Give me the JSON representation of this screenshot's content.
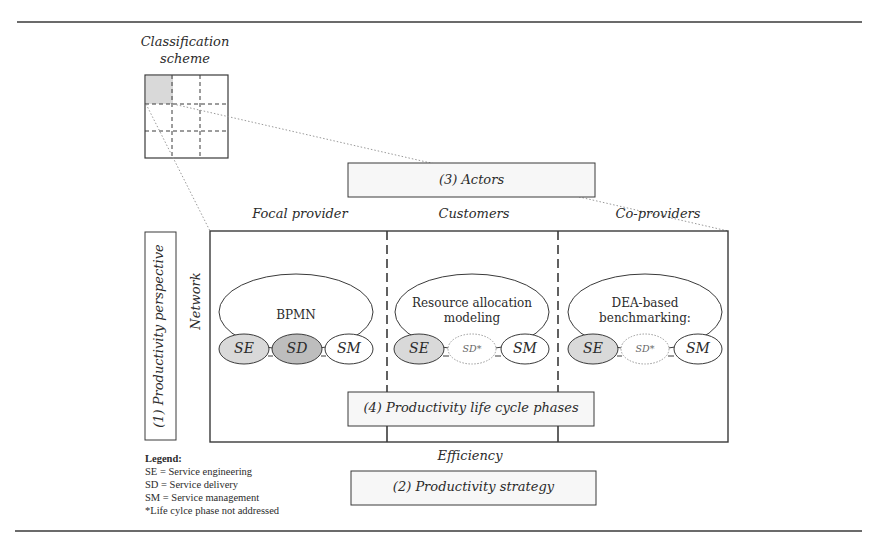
{
  "classification": {
    "title_line1": "Classification",
    "title_line2": "scheme"
  },
  "dimensions": {
    "actors": "(3) Actors",
    "perspective": "(1) Productivity perspective",
    "strategy": "(2) Productivity strategy",
    "phases": "(4) Productivity life cycle phases"
  },
  "axis_labels": {
    "network": "Network",
    "efficiency": "Efficiency"
  },
  "columns": [
    {
      "header": "Focal provider",
      "method": "BPMN",
      "method_line2": "",
      "phases": [
        {
          "label": "SE",
          "state": "addressed-shaded"
        },
        {
          "label": "SD",
          "state": "addressed-dark"
        },
        {
          "label": "SM",
          "state": "addressed-plain"
        }
      ]
    },
    {
      "header": "Customers",
      "method": "Resource allocation",
      "method_line2": "modeling",
      "phases": [
        {
          "label": "SE",
          "state": "addressed-shaded"
        },
        {
          "label": "SD*",
          "state": "not-addressed"
        },
        {
          "label": "SM",
          "state": "addressed-plain"
        }
      ]
    },
    {
      "header": "Co-providers",
      "method": "DEA-based",
      "method_line2": "benchmarking:",
      "phases": [
        {
          "label": "SE",
          "state": "addressed-shaded"
        },
        {
          "label": "SD*",
          "state": "not-addressed"
        },
        {
          "label": "SM",
          "state": "addressed-plain"
        }
      ]
    }
  ],
  "legend": {
    "title": "Legend:",
    "items": [
      "SE = Service engineering",
      "SD = Service delivery",
      "SM = Service management",
      "*Life cylce phase not addressed"
    ]
  },
  "colors": {
    "line": "#3a3a3a",
    "shade_light": "#d9d9d9",
    "shade_dark": "#bdbdbd",
    "dotted": "#9a9a9a"
  }
}
